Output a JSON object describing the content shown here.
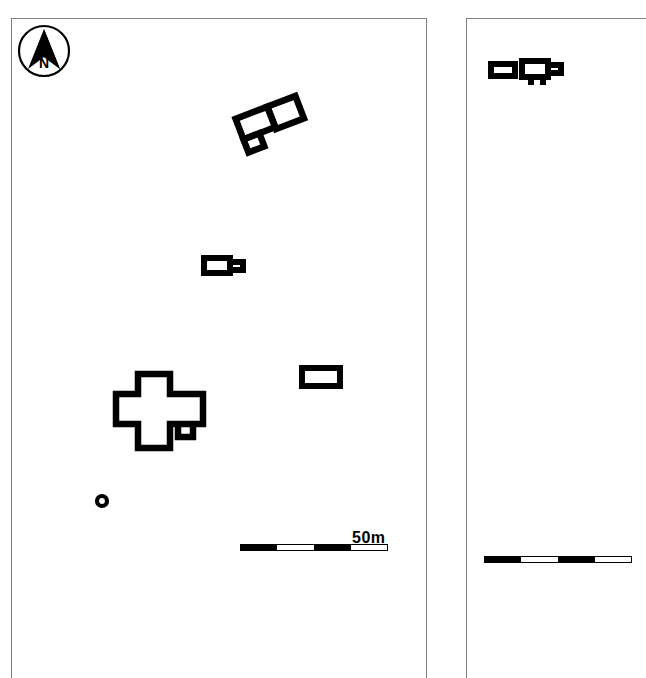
{
  "figure": {
    "type": "archaeological-site-plan",
    "background_color": "#ffffff",
    "ink_color": "#000000",
    "panel_border_color": "#7d7d7d",
    "width": 587,
    "height": 643
  },
  "north_arrow": {
    "name": "north-arrow",
    "label": "N",
    "description": "circle enclosing a solid arrow pointing to top of page",
    "cx": 44,
    "cy": 51,
    "r": 26
  },
  "panels": [
    {
      "id": "panel-left",
      "name": "site-plan-left",
      "x": 11,
      "y": 18,
      "width": 416,
      "height": 660,
      "has_north_arrow": true,
      "scalebar": {
        "label": "50m",
        "length_px": 148,
        "segments": 4,
        "value": 50,
        "unit": "m"
      },
      "features": [
        {
          "id": "building-complex-north",
          "name": "rotated-building-complex",
          "type": "compound-rectangular-building",
          "rooms": 3,
          "rotation_deg": -21,
          "x": 231,
          "y": 94,
          "width": 78,
          "height": 62
        },
        {
          "id": "building-mid",
          "name": "rectangular-building-with-annex",
          "type": "rectangular-building-with-east-annex",
          "rooms": 2,
          "rotation_deg": 0,
          "x": 201,
          "y": 255,
          "width": 44,
          "height": 25
        },
        {
          "id": "building-cruciform",
          "name": "cruciform-building",
          "type": "cross-plan-building-with-small-annex",
          "rooms": 2,
          "rotation_deg": 0,
          "x": 112,
          "y": 371,
          "width": 98,
          "height": 83
        },
        {
          "id": "building-east",
          "name": "rectangular-building-east",
          "type": "simple-rectangular-building",
          "rooms": 1,
          "rotation_deg": 0,
          "x": 301,
          "y": 367,
          "width": 42,
          "height": 22
        },
        {
          "id": "circular-feature",
          "name": "circular-feature-well",
          "type": "circular-feature",
          "x": 95,
          "y": 494,
          "diameter": 13
        }
      ]
    },
    {
      "id": "panel-right",
      "name": "site-plan-right",
      "x": 466,
      "y": 18,
      "width": 180,
      "height": 660,
      "has_north_arrow": false,
      "scalebar": {
        "label": "",
        "length_px": 148,
        "segments": 4,
        "value": 50,
        "unit": "m"
      },
      "features": [
        {
          "id": "building-right-a",
          "name": "small-rectangular-building",
          "type": "simple-rectangular-building",
          "rooms": 1,
          "rotation_deg": 0,
          "x": 490,
          "y": 62,
          "width": 29,
          "height": 17
        },
        {
          "id": "building-right-b",
          "name": "rectangular-building-with-annex",
          "type": "rectangular-building-with-east-annex-and-foot",
          "rooms": 2,
          "rotation_deg": 0,
          "x": 521,
          "y": 60,
          "width": 40,
          "height": 26
        }
      ]
    }
  ]
}
